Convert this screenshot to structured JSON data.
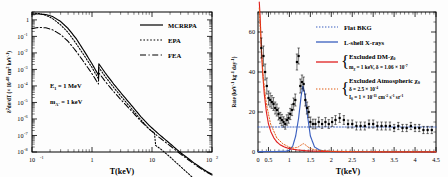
{
  "figure": {
    "panels": [
      "left-differential-cross-section",
      "right-rate-spectrum"
    ]
  },
  "left_panel": {
    "xlabel": "T(keV)",
    "ylabel_main": "dσ/dT (× 10",
    "ylabel_prefix": "δ",
    "ylabel_prefix_sup": "2",
    "ylabel_exp": "-48",
    "ylabel_tail": " cm",
    "ylabel_tail_sup": "2",
    "ylabel_tail2": " keV",
    "ylabel_tail2_sup": "-1",
    "ylabel_close": ")",
    "xticks": [
      "10",
      "1",
      "10",
      "10"
    ],
    "xtick_exps": [
      "-1",
      "",
      "",
      "2"
    ],
    "ytick_top": "1",
    "yticks_exp": [
      "-1",
      "-2",
      "-3",
      "-4",
      "-5",
      "-6",
      "-7",
      "-8"
    ],
    "annotations": [
      {
        "lead": "E",
        "sub": "1",
        "rest": " = 1 MeV"
      },
      {
        "lead": "m",
        "sub": "A′",
        "rest": " = 1 keV"
      }
    ],
    "legend": [
      {
        "label": "MCRRPA",
        "style": "solid"
      },
      {
        "label": "EPA",
        "style": "dotted"
      },
      {
        "label": "FEA",
        "style": "dashdot"
      }
    ]
  },
  "right_panel": {
    "xlabel": "T(keV)",
    "ylabel_lead": "Rate (keV",
    "ylabel_sup1": "-1",
    "ylabel_mid": " kg",
    "ylabel_sup2": "-1",
    "ylabel_mid2": " day",
    "ylabel_sup3": "-1",
    "ylabel_close": ")",
    "xticks": [
      "0",
      "0.5",
      "1",
      "1.5",
      "2",
      "2.5",
      "3",
      "3.5",
      "4",
      "4.5"
    ],
    "yticks": [
      "0",
      "20",
      "40",
      "60"
    ],
    "legend": [
      {
        "label": "Flat BKG",
        "style": "dotted",
        "color": "#3a5fbf"
      },
      {
        "label": "L-shell X-rays",
        "style": "solid",
        "color": "#3a5fbf"
      },
      {
        "label": "Excluded DM-",
        "label_chi": "χ",
        "label_chi_sub": "0",
        "style": "solid",
        "color": "#e02020"
      },
      {
        "label": "Excluded Atmospheric ",
        "label_chi": "χ",
        "label_chi_sub": "0",
        "style": "dotted",
        "color": "#e05a10"
      }
    ],
    "legend_sub_dm": {
      "m_lead": "m",
      "m_sub": "χ",
      "m_rest": " = 1 keV,  δ = 1.06 × 10",
      "m_exp": "-7"
    },
    "legend_sub_atm": {
      "line1_lead": "δ = 2.5 × 10",
      "line1_exp": "-4",
      "line2_lead": "I",
      "line2_sub": "0",
      "line2_mid": " = 1 × 10",
      "line2_exp": "-11",
      "line2_tail": " cm",
      "line2_tail_sup": "-2",
      "line2_tail2": " s",
      "line2_tail2_sup": "-1",
      "line2_tail3": " sr",
      "line2_tail3_sup": "-1"
    }
  },
  "chart_data": [
    {
      "type": "line",
      "id": "left-differential-cross-section",
      "title": "",
      "xlabel": "T(keV)",
      "ylabel": "δ²dσ/dT (× 10^-48 cm² keV^-1)",
      "xscale": "log",
      "yscale": "log",
      "xlim": [
        0.1,
        100
      ],
      "ylim": [
        1e-08,
        3
      ],
      "grid": false,
      "legend_position": "top-right",
      "annotations": [
        "E₁ = 1 MeV",
        "m_A′ = 1 keV"
      ],
      "series": [
        {
          "name": "MCRRPA",
          "style": "solid",
          "x": [
            0.1,
            0.13,
            0.17,
            0.22,
            0.3,
            0.4,
            0.55,
            0.75,
            1.0,
            1.28,
            1.3,
            1.7,
            2.3,
            3.2,
            4.5,
            6.5,
            9.0,
            13.0,
            20.0,
            30.0,
            50.0,
            75.0,
            100.0
          ],
          "y": [
            2.2,
            2.3,
            2.1,
            1.6,
            0.8,
            0.3,
            0.07,
            0.012,
            0.0022,
            0.00045,
            0.0022,
            0.00055,
            0.00013,
            3e-05,
            7e-06,
            1.4e-06,
            4e-07,
            1.2e-07,
            3.2e-08,
            9e-09,
            2.2e-09,
            8e-10,
            4.5e-10
          ]
        },
        {
          "name": "EPA",
          "style": "dotted",
          "x": [
            0.1,
            0.13,
            0.17,
            0.22,
            0.3,
            0.4,
            0.55,
            0.75,
            1.0,
            1.28,
            1.3,
            1.7,
            2.3,
            3.2,
            4.5,
            6.5,
            9.0,
            11.0,
            11.5,
            14.0,
            20.0,
            30.0,
            50.0,
            75.0,
            100.0
          ],
          "y": [
            2.6,
            2.4,
            1.9,
            1.2,
            0.5,
            0.17,
            0.035,
            0.0065,
            0.0013,
            0.00027,
            0.0013,
            0.00033,
            8e-05,
            1.9e-05,
            4.5e-06,
            9e-07,
            2.4e-07,
            1.4e-07,
            2.5e-08,
            1.5e-08,
            5e-09,
            1.3e-09,
            2.4e-10,
            6e-11,
            2e-11
          ]
        },
        {
          "name": "FEA",
          "style": "dashdot",
          "x": [
            0.1,
            0.13,
            0.17,
            0.22,
            0.3,
            0.4,
            0.55,
            0.75,
            1.0,
            1.28,
            1.3,
            1.7,
            2.3,
            3.2,
            4.5,
            6.5,
            9.0,
            13.0,
            20.0,
            30.0,
            50.0,
            75.0,
            100.0
          ],
          "y": [
            0.3,
            0.35,
            0.33,
            0.25,
            0.13,
            0.05,
            0.012,
            0.0025,
            0.00055,
            0.00013,
            0.00062,
            0.00017,
            4.5e-05,
            1.2e-05,
            3.2e-06,
            7.5e-07,
            2.4e-07,
            8e-08,
            2.4e-08,
            7.5e-09,
            1.9e-09,
            7e-10,
            4e-10
          ]
        }
      ]
    },
    {
      "type": "scatter",
      "id": "right-rate-spectrum",
      "title": "",
      "xlabel": "T(keV)",
      "ylabel": "Rate (keV^-1 kg^-1 day^-1)",
      "xscale": "linear",
      "yscale": "linear",
      "xlim": [
        0.25,
        4.5
      ],
      "ylim": [
        0,
        70
      ],
      "grid": false,
      "legend_position": "top-right",
      "series": [
        {
          "name": "data",
          "style": "points-with-errorbars",
          "x": [
            0.33,
            0.38,
            0.42,
            0.46,
            0.5,
            0.54,
            0.58,
            0.62,
            0.66,
            0.7,
            0.74,
            0.78,
            0.82,
            0.86,
            0.9,
            0.94,
            0.98,
            1.02,
            1.06,
            1.1,
            1.14,
            1.18,
            1.22,
            1.26,
            1.3,
            1.34,
            1.38,
            1.42,
            1.46,
            1.5,
            1.56,
            1.62,
            1.7,
            1.78,
            1.86,
            1.94,
            2.02,
            2.1,
            2.2,
            2.3,
            2.4,
            2.5,
            2.6,
            2.7,
            2.8,
            2.9,
            3.0,
            3.1,
            3.2,
            3.3,
            3.4,
            3.5,
            3.6,
            3.7,
            3.8,
            3.9,
            4.0,
            4.1,
            4.2,
            4.3,
            4.4
          ],
          "y": [
            52,
            48,
            40,
            33,
            27,
            26,
            25,
            24,
            22,
            21,
            19,
            17,
            16,
            15,
            14,
            16,
            17,
            19,
            21,
            24,
            26,
            45,
            48,
            33,
            35,
            34,
            26,
            22,
            20,
            15,
            14,
            14,
            15,
            14,
            15,
            14,
            15,
            16,
            17,
            16,
            14,
            14,
            13,
            13,
            13,
            14,
            14,
            13,
            13,
            13,
            13,
            12,
            13,
            12,
            12,
            13,
            12,
            12,
            11,
            11,
            11
          ],
          "yerr": [
            5,
            5,
            4,
            4,
            3.5,
            3.5,
            3.2,
            3.2,
            3,
            3,
            3,
            2.8,
            2.8,
            2.6,
            2.6,
            2.6,
            2.6,
            2.8,
            2.8,
            3,
            3,
            4,
            4,
            3.5,
            3.5,
            3.5,
            3,
            3,
            2.8,
            2.5,
            2.4,
            2.4,
            2.4,
            2.2,
            2.2,
            2.2,
            2.2,
            2.2,
            2.2,
            2.2,
            2,
            2,
            2,
            2,
            2,
            2,
            2,
            2,
            2,
            2,
            2,
            1.8,
            1.8,
            1.8,
            1.8,
            1.8,
            1.8,
            1.8,
            1.8,
            1.8,
            1.8
          ]
        },
        {
          "name": "Flat BKG",
          "style": "dotted",
          "color": "#3a5fbf",
          "x": [
            0.25,
            4.5
          ],
          "y": [
            12.5,
            12.5
          ]
        },
        {
          "name": "L-shell X-rays",
          "style": "solid",
          "color": "#3a5fbf",
          "x": [
            0.25,
            0.9,
            1.0,
            1.08,
            1.15,
            1.22,
            1.28,
            1.32,
            1.36,
            1.42,
            1.5,
            1.6,
            1.75,
            2.0,
            4.5
          ],
          "y": [
            0.2,
            0.3,
            0.8,
            3,
            8,
            17,
            28,
            33,
            30,
            20,
            8,
            2.5,
            0.6,
            0.2,
            0.1
          ]
        },
        {
          "name": "Excluded DM-chi0",
          "style": "solid",
          "color": "#e02020",
          "x": [
            0.28,
            0.3,
            0.33,
            0.36,
            0.4,
            0.45,
            0.5,
            0.56,
            0.63,
            0.7,
            0.78,
            0.87,
            0.95,
            1.05,
            1.2,
            1.4,
            1.7,
            2.0,
            2.5,
            3.0,
            4.5
          ],
          "y": [
            75,
            68,
            52,
            40,
            29,
            20,
            14,
            10,
            7,
            5,
            3.6,
            2.6,
            2.0,
            1.5,
            1.0,
            0.6,
            0.35,
            0.25,
            0.15,
            0.1,
            0.05
          ]
        },
        {
          "name": "Excluded Atmospheric chi0",
          "style": "dotted",
          "color": "#e05a10",
          "x": [
            0.28,
            0.32,
            0.38,
            0.45,
            0.55,
            0.7,
            0.85,
            1.0,
            1.1,
            1.2,
            1.28,
            1.33,
            1.38,
            1.45,
            1.55,
            1.7,
            2.0,
            2.5,
            3.0,
            4.5
          ],
          "y": [
            72,
            55,
            36,
            24,
            14,
            7,
            4,
            2.4,
            2.0,
            2.4,
            3.5,
            4.2,
            3.6,
            2.4,
            1.4,
            0.8,
            0.4,
            0.2,
            0.12,
            0.06
          ]
        }
      ]
    }
  ]
}
